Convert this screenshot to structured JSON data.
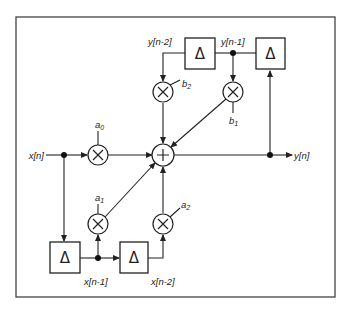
{
  "diagram": {
    "type": "signal-flow",
    "delay_symbol": "Δ",
    "multiplier_symbol": "×",
    "adder_symbol": "+",
    "signals": {
      "input": "x[n]",
      "output": "y[n]",
      "x_n1": "x[n-1]",
      "x_n2": "x[n-2]",
      "y_n1": "y[n-1]",
      "y_n2": "y[n-2]"
    },
    "coefficients": {
      "a0": {
        "base": "a",
        "sub": "0"
      },
      "a1": {
        "base": "a",
        "sub": "1"
      },
      "a2": {
        "base": "a",
        "sub": "2"
      },
      "b1": {
        "base": "b",
        "sub": "1"
      },
      "b2": {
        "base": "b",
        "sub": "2"
      }
    },
    "colors": {
      "stroke": "#222222",
      "background": "#ffffff",
      "frame": "#444444"
    }
  }
}
